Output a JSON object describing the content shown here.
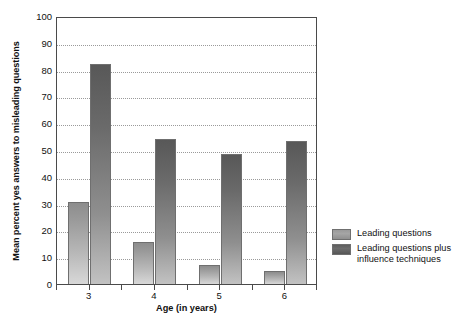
{
  "chart_data": {
    "type": "bar",
    "title": "",
    "subtitle": "",
    "xlabel": "Age (in years)",
    "ylabel": "Mean percent yes answers to misleading questions",
    "categories": [
      "3",
      "4",
      "5",
      "6"
    ],
    "series": [
      {
        "name": "Leading questions",
        "values": [
          30.5,
          15.5,
          7,
          5
        ]
      },
      {
        "name": "Leading questions plus influence techniques",
        "values": [
          82,
          54,
          48.5,
          53.5
        ]
      }
    ],
    "ylim": [
      0,
      100
    ],
    "ytick_step": 10,
    "yticks": [
      "100",
      "90",
      "80",
      "70",
      "60",
      "50",
      "40",
      "30",
      "20",
      "10",
      "0"
    ],
    "grid": true,
    "legend_position": "right",
    "colors": {
      "series_light": "#a5a5a5",
      "series_dark": "#6a6a6a",
      "axis": "#4a4a4a",
      "gridline": "#9a9a9a",
      "background": "#ffffff",
      "text": "#111111"
    }
  },
  "axes": {
    "y_title": "Mean percent yes answers to misleading questions",
    "x_title": "Age (in years)"
  },
  "legend": {
    "items": [
      {
        "label": "Leading questions",
        "swatch": "light"
      },
      {
        "label": "Leading questions plus\ninfluence techniques",
        "swatch": "dark"
      }
    ]
  }
}
